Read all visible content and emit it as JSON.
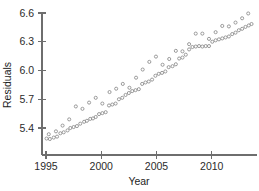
{
  "figure": {
    "width": 259,
    "height": 191,
    "background": "#ffffff",
    "marker_color": "#8a8a8a",
    "axis_color": "#6e6e6e",
    "text_color": "#2b2b2b"
  },
  "chart_data": {
    "type": "scatter",
    "title": "",
    "xlabel": "Year",
    "ylabel": "Residuals",
    "xlim": [
      1994.6,
      2013.8
    ],
    "ylim": [
      5.24,
      6.66
    ],
    "grid": false,
    "legend": null,
    "xticks": [
      1995,
      2000,
      2005,
      2010
    ],
    "xtick_labels": [
      "1995",
      "2000",
      "2005",
      "2010"
    ],
    "yticks": [
      5.4,
      5.7,
      6.0,
      6.3,
      6.6
    ],
    "ytick_labels": [
      "5.4",
      "5.7",
      "6.0",
      "6.3",
      "6.6"
    ],
    "marker": "open-circle",
    "marker_size": 3.1,
    "series": [
      {
        "name": "lower-band",
        "x": [
          1995.05,
          1995.35,
          1995.7,
          1996.0,
          1996.3,
          1996.6,
          1996.95,
          1997.2,
          1997.5,
          1997.8,
          1998.1,
          1998.45,
          1998.7,
          1999.0,
          1999.25,
          1999.5,
          1999.8,
          2000.1,
          2000.4,
          2000.7,
          2001.0,
          2001.3,
          2001.6,
          2001.9,
          2002.2,
          2002.5,
          2002.8,
          2003.1,
          2003.4,
          2003.7,
          2004.0,
          2004.3,
          2004.6,
          2004.9,
          2005.2,
          2005.5,
          2005.8,
          2006.1,
          2006.45,
          2006.75,
          2007.05,
          2007.35,
          2007.65,
          2007.95,
          2008.25,
          2008.55,
          2008.85,
          2009.15,
          2009.45,
          2009.75,
          2010.05,
          2010.35,
          2010.65,
          2010.95,
          2011.25,
          2011.55,
          2011.85,
          2012.15,
          2012.45,
          2012.75,
          2013.05,
          2013.35,
          2013.6
        ],
        "y": [
          5.29,
          5.285,
          5.3,
          5.31,
          5.345,
          5.355,
          5.375,
          5.4,
          5.41,
          5.42,
          5.445,
          5.465,
          5.475,
          5.495,
          5.5,
          5.515,
          5.545,
          5.555,
          5.565,
          5.635,
          5.645,
          5.655,
          5.7,
          5.715,
          5.745,
          5.765,
          5.785,
          5.795,
          5.805,
          5.86,
          5.875,
          5.885,
          5.905,
          5.945,
          5.965,
          5.975,
          5.99,
          6.035,
          6.045,
          6.065,
          6.125,
          6.135,
          6.165,
          6.22,
          6.245,
          6.25,
          6.255,
          6.25,
          6.255,
          6.255,
          6.3,
          6.315,
          6.325,
          6.335,
          6.345,
          6.355,
          6.38,
          6.395,
          6.42,
          6.435,
          6.455,
          6.47,
          6.485
        ]
      },
      {
        "name": "upper-band",
        "x": [
          1995.25,
          1995.9,
          1996.5,
          1997.1,
          1997.7,
          1998.3,
          1998.9,
          1999.5,
          2000.1,
          2000.75,
          2001.35,
          2001.95,
          2002.55,
          2003.15,
          2003.75,
          2004.35,
          2004.95,
          2005.55,
          2006.15,
          2006.75,
          2007.35,
          2007.95,
          2008.55,
          2009.15,
          2009.75,
          2010.35,
          2010.95,
          2011.55,
          2012.15,
          2012.75,
          2013.3
        ],
        "y": [
          5.335,
          5.365,
          5.425,
          5.49,
          5.625,
          5.6,
          5.665,
          5.715,
          5.655,
          5.775,
          5.81,
          5.86,
          5.82,
          5.925,
          6.01,
          6.09,
          6.145,
          6.06,
          6.12,
          6.205,
          6.2,
          6.275,
          6.385,
          6.385,
          6.33,
          6.4,
          6.465,
          6.46,
          6.5,
          6.545,
          6.595
        ]
      }
    ]
  }
}
